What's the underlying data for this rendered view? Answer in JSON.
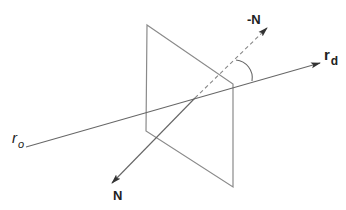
{
  "diagram": {
    "colors": {
      "stroke": "#777777",
      "text": "#222222",
      "background": "#ffffff"
    },
    "plane": {
      "corners": [
        [
          147,
          25
        ],
        [
          233,
          84
        ],
        [
          233,
          187
        ],
        [
          146,
          131
        ]
      ]
    },
    "ray": {
      "start": [
        26,
        147
      ],
      "end": [
        320,
        63
      ],
      "origin_label": {
        "base": "r",
        "sub": "o"
      },
      "direction_label": {
        "base": "r",
        "sub": "d"
      }
    },
    "normal": {
      "solid_start": [
        112,
        183
      ],
      "intersection": [
        195,
        98
      ],
      "dashed_end": [
        267,
        28
      ],
      "label": "N",
      "negative_label": "-N"
    },
    "angle_arc": {
      "path": "M236,60 A18,18 0 0 1 252,81"
    }
  }
}
